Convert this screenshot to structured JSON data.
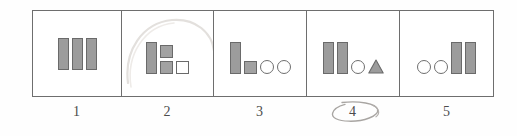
{
  "question": {
    "type": "multiple-choice-figure-options",
    "selected_option": "4",
    "selection_mark": "hand-drawn-pencil-ellipse"
  },
  "colors": {
    "shape_fill": "#9c9c9c",
    "shape_stroke": "#6a6a6a",
    "open_fill": "#ffffff",
    "frame_stroke": "#6e6e6e",
    "label_text": "#4c4c4c",
    "pencil_mark": "#9b9b9b",
    "page_background": "#fefefe"
  },
  "options": [
    {
      "label": "1",
      "selected": false,
      "shapes": [
        {
          "kind": "bar",
          "fill": "solid"
        },
        {
          "kind": "bar",
          "fill": "solid"
        },
        {
          "kind": "bar",
          "fill": "solid"
        }
      ],
      "shape_summary": "three tall solid bars"
    },
    {
      "label": "2",
      "selected": false,
      "shapes": [
        {
          "kind": "bar",
          "fill": "solid"
        },
        {
          "kind": "square",
          "fill": "solid"
        },
        {
          "kind": "square",
          "fill": "solid"
        },
        {
          "kind": "square",
          "fill": "open"
        }
      ],
      "shape_summary": "one tall solid bar, two stacked solid squares, one open square"
    },
    {
      "label": "3",
      "selected": false,
      "shapes": [
        {
          "kind": "bar",
          "fill": "solid"
        },
        {
          "kind": "square",
          "fill": "solid"
        },
        {
          "kind": "circle",
          "fill": "open"
        },
        {
          "kind": "circle",
          "fill": "open"
        }
      ],
      "shape_summary": "one tall solid bar, one solid square, two open circles"
    },
    {
      "label": "4",
      "selected": true,
      "shapes": [
        {
          "kind": "bar",
          "fill": "solid"
        },
        {
          "kind": "bar",
          "fill": "solid"
        },
        {
          "kind": "circle",
          "fill": "open"
        },
        {
          "kind": "triangle",
          "fill": "solid"
        }
      ],
      "shape_summary": "two tall solid bars, one open circle, one solid triangle"
    },
    {
      "label": "5",
      "selected": false,
      "shapes": [
        {
          "kind": "circle",
          "fill": "open"
        },
        {
          "kind": "circle",
          "fill": "open"
        },
        {
          "kind": "bar",
          "fill": "solid"
        },
        {
          "kind": "bar",
          "fill": "solid"
        }
      ],
      "shape_summary": "two open circles, two tall solid bars"
    }
  ]
}
